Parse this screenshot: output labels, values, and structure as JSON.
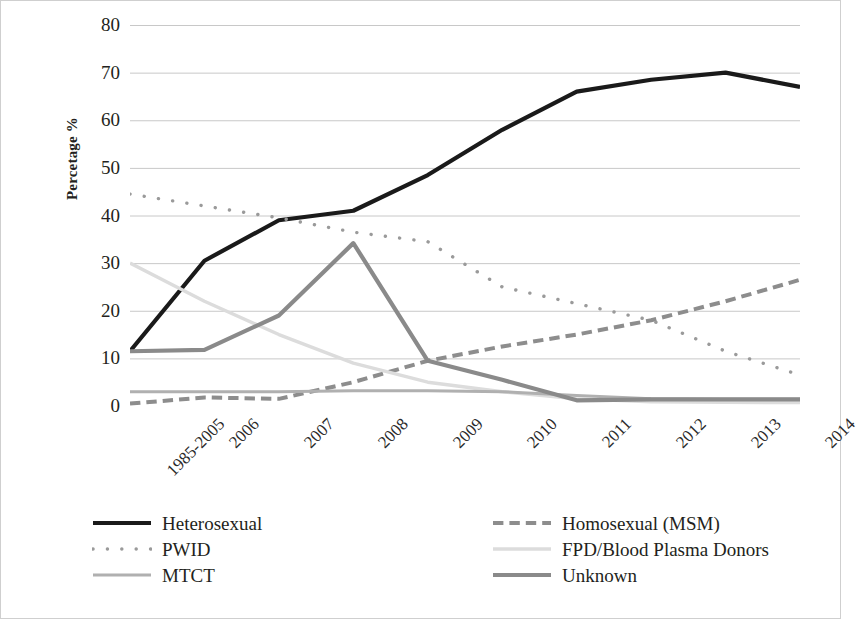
{
  "chart_data": {
    "type": "line",
    "title": "",
    "xlabel": "",
    "ylabel": "Percetage %",
    "ylim": [
      0,
      80
    ],
    "ytick_step": 10,
    "yticks": [
      80,
      70,
      60,
      50,
      40,
      30,
      20,
      10,
      0
    ],
    "grid": true,
    "legend_position": "bottom",
    "categories": [
      "1985-2005",
      "2006",
      "2007",
      "2008",
      "2009",
      "2010",
      "2011",
      "2012",
      "2013",
      "2014"
    ],
    "series": [
      {
        "name": "Heterosexual",
        "style": "solid",
        "color": "#1a1a1a",
        "width": 4.2,
        "values": [
          11.5,
          30.5,
          39.0,
          41.0,
          48.5,
          58.0,
          66.0,
          68.5,
          70.0,
          67.0
        ]
      },
      {
        "name": "Homosexual (MSM)",
        "style": "dashed",
        "color": "#8d8d8d",
        "width": 4.0,
        "values": [
          0.5,
          1.8,
          1.5,
          5.0,
          9.5,
          12.5,
          15.0,
          18.0,
          22.0,
          26.5
        ]
      },
      {
        "name": "PWID",
        "style": "dotted",
        "color": "#9a9a9a",
        "width": 3.4,
        "values": [
          44.5,
          42.0,
          39.5,
          36.5,
          34.5,
          25.0,
          21.5,
          18.0,
          11.5,
          6.5
        ]
      },
      {
        "name": "FPD/Blood Plasma Donors",
        "style": "solid",
        "color": "#dcdcdc",
        "width": 3.4,
        "values": [
          30.0,
          22.0,
          15.0,
          9.0,
          5.0,
          3.0,
          1.5,
          0.9,
          0.8,
          0.7
        ]
      },
      {
        "name": "MTCT",
        "style": "solid",
        "color": "#b0b0b0",
        "width": 3.0,
        "values": [
          3.0,
          3.0,
          3.0,
          3.2,
          3.2,
          3.0,
          2.2,
          1.5,
          1.4,
          1.4
        ]
      },
      {
        "name": "Unknown",
        "style": "solid",
        "color": "#8a8a8a",
        "width": 4.2,
        "values": [
          11.5,
          11.8,
          19.0,
          34.2,
          9.5,
          5.5,
          1.2,
          1.4,
          1.4,
          1.4
        ]
      }
    ],
    "pwid_scatter_note": "PWID drawn as a dotted trend path between the listed category values"
  },
  "axis": {
    "y_title": "Percetage %"
  },
  "legend": {
    "items": [
      {
        "label": "Heterosexual",
        "key": "heterosexual"
      },
      {
        "label": "Homosexual (MSM)",
        "key": "homosexual-msm"
      },
      {
        "label": "PWID",
        "key": "pwid"
      },
      {
        "label": "FPD/Blood Plasma Donors",
        "key": "fpd-blood-plasma-donors"
      },
      {
        "label": "MTCT",
        "key": "mtct"
      },
      {
        "label": "Unknown",
        "key": "unknown"
      }
    ]
  },
  "colors": {
    "heterosexual": "#1a1a1a",
    "homosexual": "#8d8d8d",
    "pwid": "#9a9a9a",
    "fpd": "#dcdcdc",
    "mtct": "#b0b0b0",
    "unknown": "#8a8a8a",
    "gridline": "#c8c8c8",
    "text": "#231f20"
  }
}
